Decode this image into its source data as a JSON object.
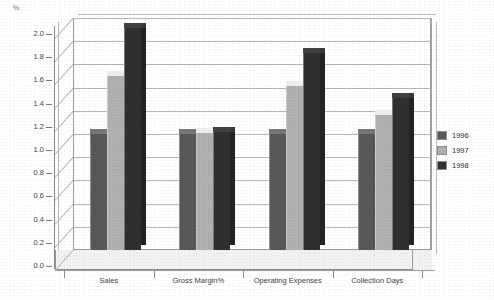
{
  "chart_data": {
    "type": "bar",
    "title": "",
    "subtitle": "",
    "xlabel": "",
    "ylabel": "%",
    "ylim": [
      0.0,
      2.0
    ],
    "ytick_step": 0.2,
    "grid": true,
    "legend_position": "right",
    "style": "3d-grouped-column-grayscale",
    "categories": [
      "Sales",
      "Gross Margin%",
      "Operating Expenses",
      "Collection Days"
    ],
    "ytick_labels": [
      "0.0",
      "0.2",
      "0.4",
      "0.6",
      "0.8",
      "1.0",
      "1.2",
      "1.4",
      "1.6",
      "1.8",
      "2.0"
    ],
    "series": [
      {
        "name": "1996",
        "color": "#585858",
        "values": [
          1.0,
          1.0,
          1.0,
          1.0
        ]
      },
      {
        "name": "1997",
        "color": "#b0b0b0",
        "values": [
          1.5,
          1.01,
          1.41,
          1.16
        ]
      },
      {
        "name": "1998",
        "color": "#303030",
        "values": [
          1.91,
          1.02,
          1.7,
          1.31
        ]
      }
    ]
  },
  "axis": {
    "corner_glyph": "%",
    "corner_glyph_name": "y-axis-unit-label"
  },
  "legend": {
    "items": [
      {
        "label": "1996",
        "color": "#585858"
      },
      {
        "label": "1997",
        "color": "#b0b0b0"
      },
      {
        "label": "1998",
        "color": "#303030"
      }
    ]
  },
  "colors": {
    "series_1996": "#585858",
    "series_1997": "#b0b0b0",
    "series_1998": "#303030",
    "gridline": "#b5b5b5",
    "axis": "#8a8a8a",
    "background": "#ffffff",
    "text": "#3a3a3a"
  }
}
